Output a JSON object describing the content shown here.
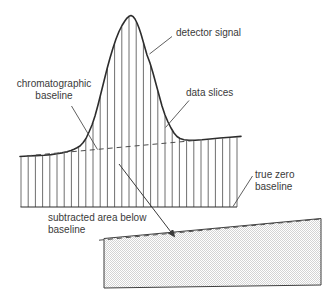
{
  "figure": {
    "labels": {
      "detector_signal": "detector signal",
      "chromatographic_baseline": [
        "chromatographic",
        "baseline"
      ],
      "data_slices": "data slices",
      "true_zero_baseline": [
        "true zero",
        "baseline"
      ],
      "subtracted_area": [
        "subtracted area below",
        "baseline"
      ]
    },
    "colors": {
      "background": "#ffffff",
      "curve": "#2d2d2d",
      "slice_lines": "#4a4a4a",
      "dashed_baseline": "#4d4d4d",
      "leader_lines": "#4d4d4d",
      "arrow": "#3a3a3a",
      "text": "#3a3a3a",
      "area_border": "#3f3f3f",
      "area_stipple": "#d4d4d4"
    }
  }
}
